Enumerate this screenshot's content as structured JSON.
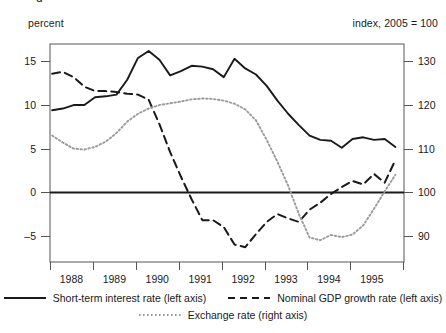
{
  "axis_units": {
    "left": "percent",
    "right": "index, 2005 = 100"
  },
  "legend": {
    "rows": [
      [
        {
          "label": "Short-term interest  rate (left axis)",
          "style": "solid",
          "name": "legend-short-term-interest-rate"
        },
        {
          "label": "Nominal GDP growth rate  (left axis)",
          "style": "dashed",
          "name": "legend-nominal-gdp-growth-rate"
        }
      ],
      [
        {
          "label": "Exchange rate (right axis)",
          "style": "dotted",
          "name": "legend-exchange-rate"
        }
      ]
    ]
  },
  "chart_data": {
    "type": "line",
    "title": "",
    "xlabel": "",
    "ylabel": "percent",
    "y2label": "index, 2005 = 100",
    "grid": false,
    "legend_position": "bottom",
    "xlim": [
      1987.5,
      1995.75
    ],
    "ylim": [
      -8.0,
      17.0
    ],
    "y2lim": [
      84.0,
      134.0
    ],
    "yticks": [
      -5,
      0,
      5,
      10,
      15
    ],
    "y2ticks": [
      90,
      100,
      110,
      120,
      130
    ],
    "xticks": [
      1988,
      1989,
      1990,
      1991,
      1992,
      1993,
      1994,
      1995
    ],
    "xtick_labels": [
      "1988",
      "1989",
      "1990",
      "1991",
      "1992",
      "1993",
      "1994",
      "1995"
    ],
    "zero_line": 0,
    "series": [
      {
        "name": "Short-term interest  rate (left axis)",
        "axis": "left",
        "style": "solid",
        "color": "#1a1a1a",
        "x": [
          1987.55,
          1987.8,
          1988.05,
          1988.3,
          1988.55,
          1988.8,
          1989.05,
          1989.3,
          1989.55,
          1989.8,
          1990.05,
          1990.3,
          1990.55,
          1990.8,
          1991.05,
          1991.3,
          1991.55,
          1991.8,
          1992.05,
          1992.3,
          1992.55,
          1992.8,
          1993.05,
          1993.3,
          1993.55,
          1993.8,
          1994.05,
          1994.3,
          1994.55,
          1994.8,
          1995.05,
          1995.3,
          1995.55
        ],
        "values": [
          9.4,
          9.6,
          10.0,
          10.0,
          10.9,
          11.0,
          11.2,
          12.9,
          15.4,
          16.2,
          15.2,
          13.4,
          13.9,
          14.5,
          14.4,
          14.1,
          13.2,
          15.3,
          14.2,
          13.5,
          12.2,
          10.5,
          9.0,
          7.7,
          6.5,
          6.0,
          5.9,
          5.1,
          6.1,
          6.3,
          6.0,
          6.1,
          5.2
        ]
      },
      {
        "name": "Nominal GDP growth rate  (left axis)",
        "axis": "left",
        "style": "dashed",
        "color": "#1a1a1a",
        "x": [
          1987.55,
          1987.8,
          1988.05,
          1988.3,
          1988.55,
          1988.8,
          1989.05,
          1989.3,
          1989.55,
          1989.8,
          1990.05,
          1990.3,
          1990.55,
          1990.8,
          1991.05,
          1991.3,
          1991.55,
          1991.8,
          1992.05,
          1992.3,
          1992.55,
          1992.8,
          1993.05,
          1993.3,
          1993.55,
          1993.8,
          1994.05,
          1994.3,
          1994.55,
          1994.8,
          1995.05,
          1995.3,
          1995.55
        ],
        "values": [
          13.6,
          13.8,
          13.2,
          12.1,
          11.6,
          11.6,
          11.5,
          11.3,
          11.2,
          10.6,
          7.8,
          4.6,
          1.8,
          -0.8,
          -3.2,
          -3.2,
          -4.0,
          -6.0,
          -6.3,
          -4.8,
          -3.4,
          -2.5,
          -3.0,
          -3.4,
          -2.0,
          -1.2,
          -0.2,
          0.6,
          1.3,
          0.9,
          2.1,
          1.1,
          3.7
        ]
      },
      {
        "name": "Exchange rate (right axis)",
        "axis": "right",
        "style": "dotted",
        "color": "#9a9a9a",
        "x": [
          1987.55,
          1987.8,
          1988.05,
          1988.3,
          1988.55,
          1988.8,
          1989.05,
          1989.3,
          1989.55,
          1989.8,
          1990.05,
          1990.3,
          1990.55,
          1990.8,
          1991.05,
          1991.3,
          1991.55,
          1991.8,
          1992.05,
          1992.3,
          1992.55,
          1992.8,
          1993.05,
          1993.3,
          1993.55,
          1993.8,
          1994.05,
          1994.3,
          1994.55,
          1994.8,
          1995.05,
          1995.3,
          1995.55
        ],
        "values": [
          113.0,
          111.4,
          110.0,
          109.8,
          110.4,
          111.6,
          113.6,
          116.2,
          118.0,
          119.2,
          120.0,
          120.4,
          120.8,
          121.3,
          121.5,
          121.4,
          121.0,
          120.3,
          119.0,
          116.5,
          112.0,
          107.0,
          101.5,
          95.0,
          89.6,
          89.0,
          90.2,
          89.7,
          90.3,
          92.4,
          96.2,
          100.2,
          104.0
        ]
      }
    ]
  }
}
